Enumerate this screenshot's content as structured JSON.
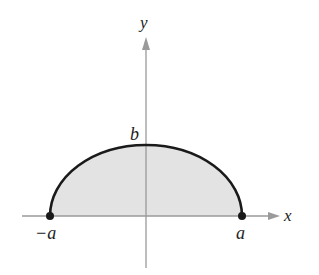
{
  "diagram": {
    "type": "half-ellipse region",
    "axes": {
      "x_label": "x",
      "y_label": "y",
      "axis_color": "#9a9a9a"
    },
    "labels": {
      "left": "−a",
      "right": "a",
      "top": "b"
    },
    "curve": {
      "color": "#1a1a1a",
      "fill": "#e3e3e3"
    },
    "points": [
      {
        "name": "left-endpoint",
        "label": "−a"
      },
      {
        "name": "right-endpoint",
        "label": "a"
      }
    ]
  }
}
